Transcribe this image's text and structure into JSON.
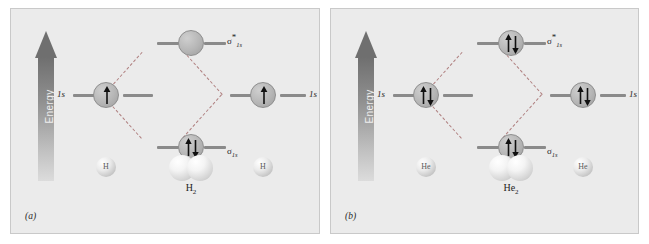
{
  "figure": {
    "type": "molecular-orbital-energy-diagram",
    "background_color": "#ebebeb",
    "page_color": "#ffffff",
    "accent_dashed_color": "#b08080",
    "orbital_fill_color": "#b6b6b6",
    "level_line_color": "#8a8a8a"
  },
  "panels": [
    {
      "caption": "(a)",
      "energy_axis": {
        "label": "Energy",
        "direction": "up",
        "arrow_gradient_top": "#6f6f6f",
        "arrow_gradient_bottom": "#dcdcdc"
      },
      "atomic_orbitals": [
        {
          "side": "left",
          "label": "1s",
          "electrons": 1,
          "spins": [
            "up"
          ]
        },
        {
          "side": "right",
          "label": "1s",
          "electrons": 1,
          "spins": [
            "up"
          ]
        }
      ],
      "molecular_orbitals": [
        {
          "kind": "antibonding",
          "label_sigma": "σ",
          "label_star": "*",
          "label_sub": "1s",
          "electrons": 0,
          "spins": []
        },
        {
          "kind": "bonding",
          "label_sigma": "σ",
          "label_star": "",
          "label_sub": "1s",
          "electrons": 2,
          "spins": [
            "up",
            "down"
          ]
        }
      ],
      "species": {
        "left_atom": "H",
        "right_atom": "H",
        "molecule_base": "H",
        "molecule_sub": "2"
      }
    },
    {
      "caption": "(b)",
      "energy_axis": {
        "label": "Energy",
        "direction": "up",
        "arrow_gradient_top": "#6f6f6f",
        "arrow_gradient_bottom": "#dcdcdc"
      },
      "atomic_orbitals": [
        {
          "side": "left",
          "label": "1s",
          "electrons": 2,
          "spins": [
            "up",
            "down"
          ]
        },
        {
          "side": "right",
          "label": "1s",
          "electrons": 2,
          "spins": [
            "up",
            "down"
          ]
        }
      ],
      "molecular_orbitals": [
        {
          "kind": "antibonding",
          "label_sigma": "σ",
          "label_star": "*",
          "label_sub": "1s",
          "electrons": 2,
          "spins": [
            "up",
            "down"
          ]
        },
        {
          "kind": "bonding",
          "label_sigma": "σ",
          "label_star": "",
          "label_sub": "1s",
          "electrons": 2,
          "spins": [
            "up",
            "down"
          ]
        }
      ],
      "species": {
        "left_atom": "He",
        "right_atom": "He",
        "molecule_base": "He",
        "molecule_sub": "2"
      }
    }
  ]
}
